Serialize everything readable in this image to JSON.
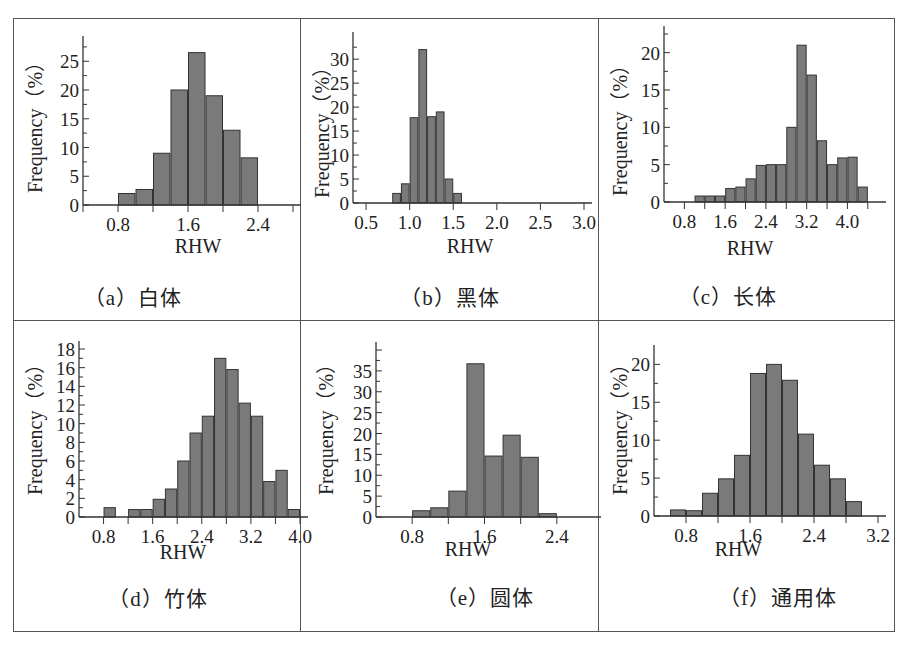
{
  "chart_data": [
    {
      "id": "a",
      "type": "bar",
      "title": "（a）白体",
      "xlabel": "RHW",
      "ylabel": "Frequency（%）",
      "bin_width": 0.2,
      "x_start": 0.8,
      "xlim": [
        0.4,
        2.8
      ],
      "ylim": [
        0,
        28
      ],
      "x_ticks": [
        0.8,
        1.6,
        2.4
      ],
      "x_minor": [
        0.4,
        1.2,
        2.0,
        2.8
      ],
      "y_ticks": [
        0,
        5,
        10,
        15,
        20,
        25
      ],
      "values": [
        2.0,
        2.7,
        9.0,
        20.0,
        26.5,
        19.0,
        13.0,
        8.2
      ]
    },
    {
      "id": "b",
      "type": "bar",
      "title": "（b）黑体",
      "xlabel": "RHW",
      "ylabel": "Frequency（%）",
      "bin_width": 0.1,
      "x_start": 0.8,
      "xlim": [
        0.35,
        3.0
      ],
      "ylim": [
        0,
        34
      ],
      "x_ticks": [
        0.5,
        1.0,
        1.5,
        2.0,
        2.5,
        3.0
      ],
      "x_minor": [],
      "y_ticks": [
        0,
        5,
        10,
        15,
        20,
        25,
        30
      ],
      "values": [
        2.0,
        4.0,
        17.8,
        32.0,
        18.0,
        19.0,
        5.0,
        2.0
      ]
    },
    {
      "id": "c",
      "type": "bar",
      "title": "（c）长体",
      "xlabel": "RHW",
      "ylabel": "Frequency（%）",
      "bin_width": 0.2,
      "x_start": 1.0,
      "xlim": [
        0.4,
        4.6
      ],
      "ylim": [
        0,
        22.5
      ],
      "x_ticks": [
        0.8,
        1.6,
        2.4,
        3.2,
        4.0
      ],
      "x_minor": [
        1.2,
        2.0,
        2.8,
        3.6,
        4.4
      ],
      "y_ticks": [
        0,
        5,
        10,
        15,
        20
      ],
      "values": [
        0.8,
        0.8,
        0.8,
        1.8,
        2.0,
        3.1,
        4.9,
        5.0,
        5.0,
        10.0,
        21.0,
        17.0,
        8.2,
        5.0,
        5.9,
        6.0,
        2.0
      ]
    },
    {
      "id": "d",
      "type": "bar",
      "title": "（d）竹体",
      "xlabel": "RHW",
      "ylabel": "Frequency（%）",
      "bin_width": 0.2,
      "x_start": 0.8,
      "xlim": [
        0.4,
        4.0
      ],
      "ylim": [
        0,
        18
      ],
      "x_ticks": [
        0.8,
        1.6,
        2.4,
        3.2,
        4.0
      ],
      "x_minor": [
        1.2,
        2.0,
        2.8,
        3.6
      ],
      "y_ticks": [
        0,
        2,
        4,
        6,
        8,
        10,
        12,
        14,
        16,
        18
      ],
      "values": [
        1.0,
        0,
        0.8,
        0.8,
        1.9,
        3.0,
        6.0,
        9.0,
        10.8,
        17.0,
        15.8,
        12.2,
        10.8,
        3.8,
        5.0,
        0.8
      ]
    },
    {
      "id": "e",
      "type": "bar",
      "title": "（e）圆体",
      "xlabel": "RHW",
      "ylabel": "Frequency（%）",
      "bin_width": 0.2,
      "x_start": 0.8,
      "xlim": [
        0.4,
        2.8
      ],
      "ylim": [
        0,
        40
      ],
      "x_ticks": [
        0.8,
        1.6,
        2.4
      ],
      "x_minor": [
        1.2,
        2.0
      ],
      "y_ticks": [
        0,
        5,
        10,
        15,
        20,
        25,
        30,
        35
      ],
      "values": [
        1.5,
        2.2,
        6.2,
        36.7,
        14.6,
        19.6,
        14.3,
        0.8
      ]
    },
    {
      "id": "f",
      "type": "bar",
      "title": "（f）通用体",
      "xlabel": "RHW",
      "ylabel": "Frequency（%）",
      "bin_width": 0.2,
      "x_start": 0.6,
      "xlim": [
        0.4,
        3.2
      ],
      "ylim": [
        0,
        21.5
      ],
      "x_ticks": [
        0.8,
        1.6,
        2.4,
        3.2
      ],
      "x_minor": [
        1.2,
        2.0,
        2.8
      ],
      "y_ticks": [
        0,
        5,
        10,
        15,
        20
      ],
      "values": [
        0.8,
        0.7,
        3.0,
        4.9,
        8.0,
        18.8,
        20.0,
        17.9,
        10.8,
        6.7,
        4.9,
        1.9
      ]
    }
  ],
  "panels": [
    {
      "caption": "（a）白体",
      "xlabel": "RHW",
      "ylabel": "Frequency（%）"
    },
    {
      "caption": "（b）黑体",
      "xlabel": "RHW",
      "ylabel": "Frequency（%）"
    },
    {
      "caption": "（c）长体",
      "xlabel": "RHW",
      "ylabel": "Frequency（%）"
    },
    {
      "caption": "（d）竹体",
      "xlabel": "RHW",
      "ylabel": "Frequency（%）"
    },
    {
      "caption": "（e）圆体",
      "xlabel": "RHW",
      "ylabel": "Frequency（%）"
    },
    {
      "caption": "（f）通用体",
      "xlabel": "RHW",
      "ylabel": "Frequency（%）"
    }
  ],
  "colors": {
    "bar_fill": "#7a7a7a",
    "bar_stroke": "#333333",
    "axis": "#333333",
    "frame": "#555555"
  }
}
